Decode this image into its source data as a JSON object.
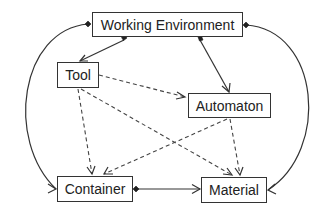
{
  "diagram": {
    "type": "object-relationship",
    "nodes": [
      {
        "id": "working-environment",
        "label": "Working Environment"
      },
      {
        "id": "tool",
        "label": "Tool"
      },
      {
        "id": "automaton",
        "label": "Automaton"
      },
      {
        "id": "container",
        "label": "Container"
      },
      {
        "id": "material",
        "label": "Material"
      }
    ],
    "edges": [
      {
        "from": "working-environment",
        "to": "tool",
        "style": "solid",
        "source_end": "diamond",
        "target_end": "arrow"
      },
      {
        "from": "working-environment",
        "to": "automaton",
        "style": "solid",
        "source_end": "diamond",
        "target_end": "arrow"
      },
      {
        "from": "working-environment",
        "to": "container",
        "style": "solid-curved",
        "source_end": "diamond",
        "target_end": "arrow"
      },
      {
        "from": "working-environment",
        "to": "material",
        "style": "solid-curved",
        "source_end": "diamond",
        "target_end": "arrow"
      },
      {
        "from": "container",
        "to": "material",
        "style": "solid",
        "source_end": "diamond",
        "target_end": "arrow"
      },
      {
        "from": "tool",
        "to": "automaton",
        "style": "dashed",
        "source_end": "none",
        "target_end": "arrow"
      },
      {
        "from": "tool",
        "to": "container",
        "style": "dashed",
        "source_end": "none",
        "target_end": "arrow"
      },
      {
        "from": "tool",
        "to": "material",
        "style": "dashed",
        "source_end": "none",
        "target_end": "arrow"
      },
      {
        "from": "automaton",
        "to": "container",
        "style": "dashed",
        "source_end": "none",
        "target_end": "arrow"
      },
      {
        "from": "automaton",
        "to": "material",
        "style": "dashed",
        "source_end": "none",
        "target_end": "arrow"
      }
    ]
  },
  "labels": {
    "working_environment": "Working Environment",
    "tool": "Tool",
    "automaton": "Automaton",
    "container": "Container",
    "material": "Material"
  },
  "colors": {
    "line": "#333333",
    "box_border": "#333333",
    "text": "#222222",
    "background": "#ffffff"
  }
}
